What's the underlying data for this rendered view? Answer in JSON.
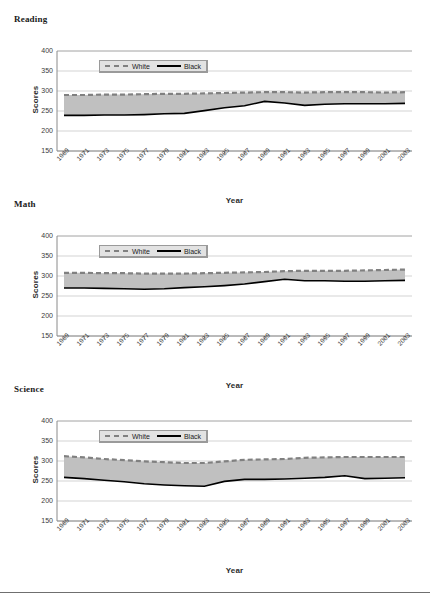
{
  "figure": {
    "axis_label_y": "Scores",
    "axis_label_x": "Year",
    "legend": {
      "white_label": "White",
      "black_label": "Black",
      "white_color": "#808080",
      "black_color": "#000000",
      "band_color": "#c0c0c0",
      "box_background": "#e2e2e2"
    },
    "y_ticks": [
      "400",
      "350",
      "300",
      "250",
      "200",
      "150"
    ],
    "x_ticks": [
      "1969",
      "1971",
      "1973",
      "1975",
      "1977",
      "1979",
      "1981",
      "1983",
      "1985",
      "1987",
      "1989",
      "1991",
      "1993",
      "1995",
      "1997",
      "1999",
      "2001",
      "2003"
    ]
  },
  "chart_data": [
    {
      "type": "line",
      "title": "Reading",
      "xlabel": "Year",
      "ylabel": "Scores",
      "ylim": [
        150,
        400
      ],
      "ytick_step": 50,
      "grid": true,
      "legend_position": "top-center",
      "x": [
        1969,
        1971,
        1973,
        1975,
        1977,
        1979,
        1981,
        1983,
        1985,
        1987,
        1989,
        1991,
        1993,
        1995,
        1997,
        1999,
        2001,
        2003
      ],
      "series": [
        {
          "name": "White",
          "style": "dashed",
          "color": "#808080",
          "values": [
            290,
            290,
            291,
            291,
            292,
            293,
            293,
            294,
            295,
            296,
            297,
            297,
            296,
            297,
            297,
            297,
            296,
            297
          ]
        },
        {
          "name": "Black",
          "style": "solid",
          "color": "#000000",
          "values": [
            239,
            239,
            240,
            240,
            241,
            243,
            244,
            251,
            258,
            263,
            274,
            270,
            264,
            267,
            268,
            268,
            268,
            269
          ]
        }
      ]
    },
    {
      "type": "line",
      "title": "Math",
      "xlabel": "Year",
      "ylabel": "Scores",
      "ylim": [
        150,
        400
      ],
      "ytick_step": 50,
      "grid": true,
      "legend_position": "top-center",
      "x": [
        1969,
        1971,
        1973,
        1975,
        1977,
        1979,
        1981,
        1983,
        1985,
        1987,
        1989,
        1991,
        1993,
        1995,
        1997,
        1999,
        2001,
        2003
      ],
      "series": [
        {
          "name": "White",
          "style": "dashed",
          "color": "#808080",
          "values": [
            308,
            308,
            307,
            307,
            306,
            306,
            306,
            307,
            308,
            309,
            310,
            312,
            313,
            313,
            313,
            314,
            315,
            316
          ]
        },
        {
          "name": "Black",
          "style": "solid",
          "color": "#000000",
          "values": [
            270,
            270,
            269,
            268,
            267,
            268,
            271,
            273,
            276,
            280,
            286,
            292,
            288,
            288,
            287,
            287,
            288,
            289
          ]
        }
      ]
    },
    {
      "type": "line",
      "title": "Science",
      "xlabel": "Year",
      "ylabel": "Scores",
      "ylim": [
        150,
        400
      ],
      "ytick_step": 50,
      "grid": true,
      "legend_position": "top-center",
      "x": [
        1969,
        1971,
        1973,
        1975,
        1977,
        1979,
        1981,
        1983,
        1985,
        1987,
        1989,
        1991,
        1993,
        1995,
        1997,
        1999,
        2001,
        2003
      ],
      "series": [
        {
          "name": "White",
          "style": "dashed",
          "color": "#808080",
          "values": [
            312,
            309,
            305,
            302,
            299,
            297,
            295,
            295,
            299,
            303,
            304,
            305,
            308,
            309,
            310,
            310,
            310,
            310
          ]
        },
        {
          "name": "Black",
          "style": "solid",
          "color": "#000000",
          "values": [
            259,
            256,
            252,
            248,
            243,
            240,
            238,
            237,
            249,
            254,
            254,
            255,
            257,
            259,
            263,
            256,
            257,
            258
          ]
        }
      ]
    }
  ]
}
